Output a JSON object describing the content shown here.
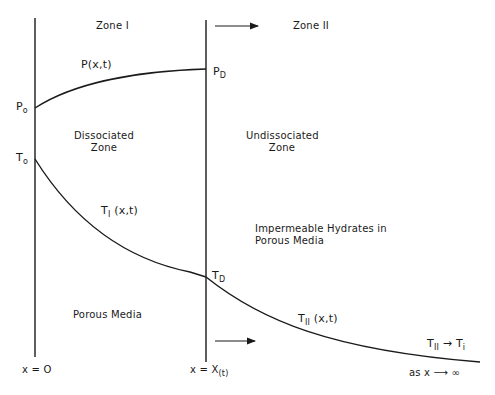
{
  "diagram": {
    "zones": {
      "zone1": {
        "label": "Zone I"
      },
      "zone2": {
        "label": "Zone II"
      }
    },
    "pressure": {
      "curve_label": "P(x,t)",
      "p0": {
        "base": "P",
        "sub": "o"
      },
      "pD": {
        "base": "P",
        "sub": "D"
      }
    },
    "temperature": {
      "t0": {
        "base": "T",
        "sub": "o"
      },
      "tD": {
        "base": "T",
        "sub": "D"
      },
      "t1_curve": {
        "base": "T",
        "sub": "I",
        "args": "(x,t)"
      },
      "t2_curve": {
        "base": "T",
        "sub": "II",
        "args": "(x,t)"
      },
      "limit": {
        "base": "T",
        "sub": "II",
        "arrow": "→",
        "target_base": "T",
        "target_sub": "i"
      }
    },
    "regions": {
      "dissociated": [
        "Dissociated",
        "Zone"
      ],
      "undissociated": [
        "Undissociated",
        "Zone"
      ],
      "impermeable": [
        "Impermeable Hydrates in",
        "Porous Media"
      ],
      "porous": "Porous Media"
    },
    "axis": {
      "origin": "x = O",
      "front": {
        "base": "x = X",
        "sub": "(t)"
      },
      "limit": "as x ⟶ ∞"
    },
    "colors": {
      "line": "#1a1a1a",
      "background": "#ffffff"
    }
  }
}
